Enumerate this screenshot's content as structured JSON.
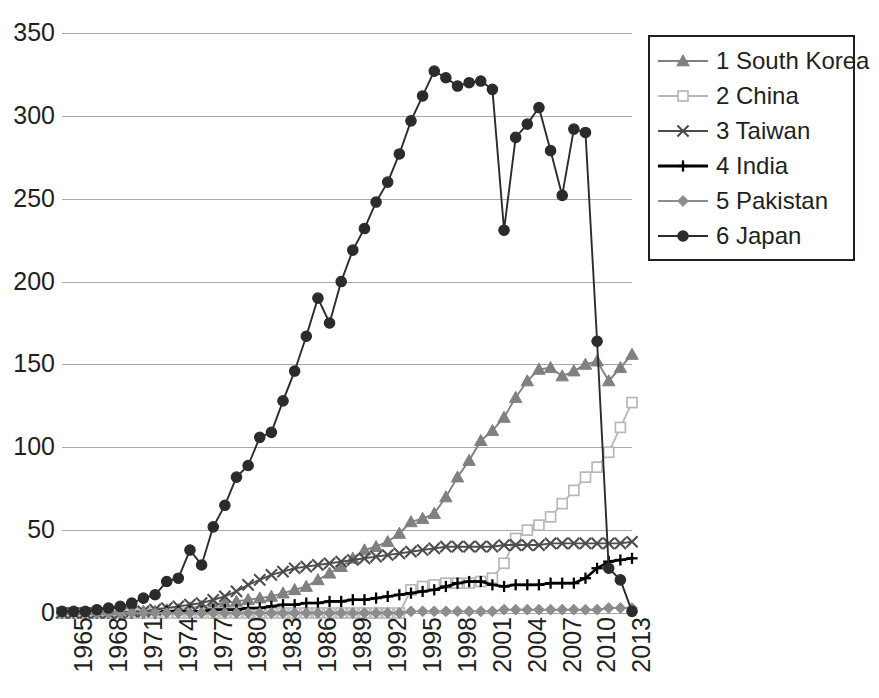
{
  "legend": {
    "position": "top-right",
    "items": [
      {
        "label": "1 South Korea",
        "marker": "triangle-icon",
        "color": "#808080"
      },
      {
        "label": "2 China",
        "marker": "open-square-icon",
        "color": "#b8b8b8"
      },
      {
        "label": "3 Taiwan",
        "marker": "x-cross-icon",
        "color": "#4d4d4d"
      },
      {
        "label": "4 India",
        "marker": "plus-icon",
        "color": "#000000"
      },
      {
        "label": "5 Pakistan",
        "marker": "diamond-icon",
        "color": "#8c8c8c"
      },
      {
        "label": "6 Japan",
        "marker": "circle-icon",
        "color": "#2b2b2b"
      }
    ]
  },
  "axes": {
    "y_ticks": [
      "0",
      "50",
      "100",
      "150",
      "200",
      "250",
      "300",
      "350"
    ],
    "x_ticks": [
      "1965",
      "1968",
      "1971",
      "1974",
      "1977",
      "1980",
      "1983",
      "1986",
      "1989",
      "1992",
      "1995",
      "1998",
      "2001",
      "2004",
      "2007",
      "2010",
      "2013"
    ]
  },
  "chart_data": {
    "type": "line",
    "title": "",
    "xlabel": "",
    "ylabel": "",
    "ylim": [
      0,
      350
    ],
    "ytick_step": 50,
    "grid": true,
    "legend_position": "top-right",
    "x": [
      1965,
      1966,
      1967,
      1968,
      1969,
      1970,
      1971,
      1972,
      1973,
      1974,
      1975,
      1976,
      1977,
      1978,
      1979,
      1980,
      1981,
      1982,
      1983,
      1984,
      1985,
      1986,
      1987,
      1988,
      1989,
      1990,
      1991,
      1992,
      1993,
      1994,
      1995,
      1996,
      1997,
      1998,
      1999,
      2000,
      2001,
      2002,
      2003,
      2004,
      2005,
      2006,
      2007,
      2008,
      2009,
      2010,
      2011,
      2012,
      2013,
      2014
    ],
    "series": [
      {
        "name": "1 South Korea",
        "marker": "triangle",
        "color": "#808080",
        "values": [
          0,
          0,
          0,
          0,
          0,
          0,
          0,
          1,
          1,
          2,
          2,
          3,
          4,
          5,
          6,
          7,
          8,
          9,
          10,
          12,
          14,
          16,
          20,
          24,
          28,
          33,
          38,
          40,
          43,
          48,
          55,
          57,
          60,
          70,
          82,
          92,
          104,
          110,
          118,
          130,
          140,
          147,
          148,
          143,
          146,
          150,
          152,
          140,
          148,
          156
        ]
      },
      {
        "name": "2 China",
        "marker": "open-square",
        "color": "#b8b8b8",
        "values": [
          0,
          0,
          0,
          0,
          0,
          0,
          0,
          0,
          0,
          0,
          0,
          0,
          0,
          0,
          0,
          0,
          0,
          0,
          0,
          0,
          0,
          0,
          0,
          0,
          0,
          0,
          0,
          0,
          0,
          0,
          14,
          16,
          17,
          18,
          18,
          18,
          19,
          21,
          30,
          45,
          50,
          53,
          58,
          66,
          74,
          82,
          88,
          97,
          112,
          127
        ]
      },
      {
        "name": "3 Taiwan",
        "marker": "x-cross",
        "color": "#4d4d4d",
        "values": [
          0,
          0,
          0,
          0,
          0,
          0,
          1,
          1,
          2,
          3,
          4,
          5,
          6,
          8,
          10,
          13,
          17,
          20,
          23,
          25,
          27,
          28,
          29,
          30,
          31,
          32,
          33,
          34,
          35,
          36,
          37,
          38,
          39,
          40,
          40,
          40,
          40,
          40,
          41,
          41,
          41,
          41,
          42,
          42,
          42,
          42,
          42,
          42,
          42,
          43
        ]
      },
      {
        "name": "4 India",
        "marker": "plus",
        "color": "#000000",
        "values": [
          0,
          0,
          0,
          0,
          0,
          0,
          0,
          0,
          0,
          1,
          1,
          1,
          1,
          2,
          2,
          2,
          3,
          3,
          4,
          5,
          5,
          6,
          6,
          7,
          7,
          8,
          8,
          9,
          10,
          11,
          12,
          13,
          14,
          16,
          18,
          19,
          19,
          17,
          16,
          17,
          17,
          17,
          18,
          18,
          18,
          21,
          27,
          31,
          32,
          33
        ]
      },
      {
        "name": "5 Pakistan",
        "marker": "diamond",
        "color": "#8c8c8c",
        "values": [
          0,
          0,
          0,
          0,
          0,
          0,
          0,
          0,
          0,
          0,
          0,
          0,
          0,
          0,
          0,
          0,
          0,
          0,
          0,
          0,
          0,
          0,
          0,
          0,
          0,
          0,
          0,
          0,
          0,
          0,
          1,
          1,
          1,
          1,
          1,
          1,
          1,
          1,
          2,
          2,
          2,
          2,
          2,
          2,
          2,
          2,
          2,
          3,
          3,
          3
        ]
      },
      {
        "name": "6 Japan",
        "marker": "circle",
        "color": "#2b2b2b",
        "values": [
          1,
          1,
          1,
          2,
          3,
          4,
          6,
          9,
          11,
          19,
          21,
          38,
          29,
          52,
          65,
          82,
          89,
          106,
          109,
          128,
          146,
          167,
          190,
          175,
          200,
          219,
          232,
          248,
          260,
          277,
          297,
          312,
          327,
          323,
          318,
          320,
          321,
          316,
          231,
          287,
          295,
          305,
          279,
          252,
          292,
          290,
          164,
          27,
          20,
          1
        ]
      }
    ]
  }
}
